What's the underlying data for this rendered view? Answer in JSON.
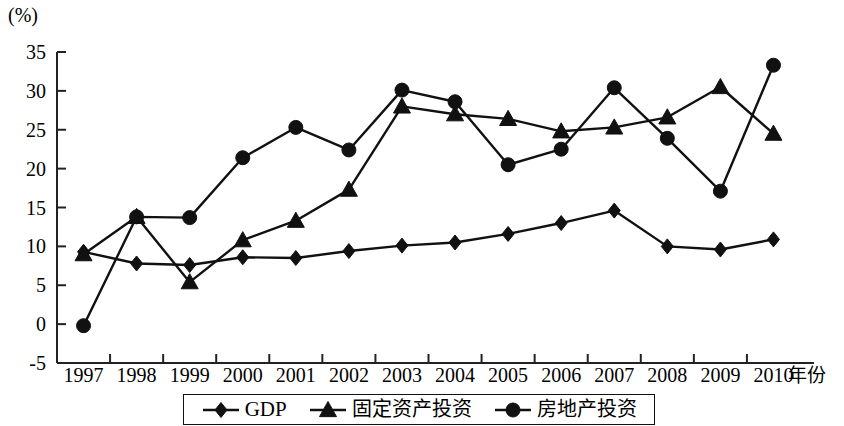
{
  "axis": {
    "unit_label": "(%)",
    "x_title": "年份",
    "y_ticks": [
      "35",
      "30",
      "25",
      "20",
      "15",
      "10",
      "5",
      "0",
      "-5"
    ],
    "x_ticks": [
      "1997",
      "1998",
      "1999",
      "2000",
      "2001",
      "2002",
      "2003",
      "2004",
      "2005",
      "2006",
      "2007",
      "2008",
      "2009",
      "2010"
    ]
  },
  "legend": {
    "items": [
      {
        "label": "GDP",
        "marker": "diamond",
        "cjk": false
      },
      {
        "label": "固定资产投资",
        "marker": "triangle",
        "cjk": true
      },
      {
        "label": "房地产投资",
        "marker": "circle",
        "cjk": true
      }
    ]
  },
  "colors": {
    "line": "#111111",
    "background": "#ffffff",
    "axis": "#222222"
  },
  "chart_data": {
    "type": "line",
    "title": "",
    "xlabel": "年份",
    "ylabel": "(%)",
    "ylim": [
      -5,
      35
    ],
    "ytick_step": 5,
    "grid": false,
    "legend_position": "bottom",
    "x": [
      "1997",
      "1998",
      "1999",
      "2000",
      "2001",
      "2002",
      "2003",
      "2004",
      "2005",
      "2006",
      "2007",
      "2008",
      "2009",
      "2010"
    ],
    "series": [
      {
        "name": "GDP",
        "marker": "diamond",
        "values": [
          9.3,
          7.8,
          7.6,
          8.6,
          8.5,
          9.4,
          10.1,
          10.5,
          11.6,
          13.0,
          14.6,
          10.0,
          9.6,
          10.9
        ]
      },
      {
        "name": "固定资产投资",
        "marker": "triangle",
        "values": [
          9.0,
          13.8,
          5.4,
          10.8,
          13.3,
          17.3,
          28.0,
          27.0,
          26.4,
          24.8,
          25.3,
          26.6,
          30.5,
          24.5
        ]
      },
      {
        "name": "房地产投资",
        "marker": "circle",
        "values": [
          -0.2,
          13.8,
          13.7,
          21.4,
          25.3,
          22.4,
          30.1,
          28.6,
          20.5,
          22.5,
          30.4,
          23.9,
          17.1,
          33.3
        ]
      }
    ]
  }
}
